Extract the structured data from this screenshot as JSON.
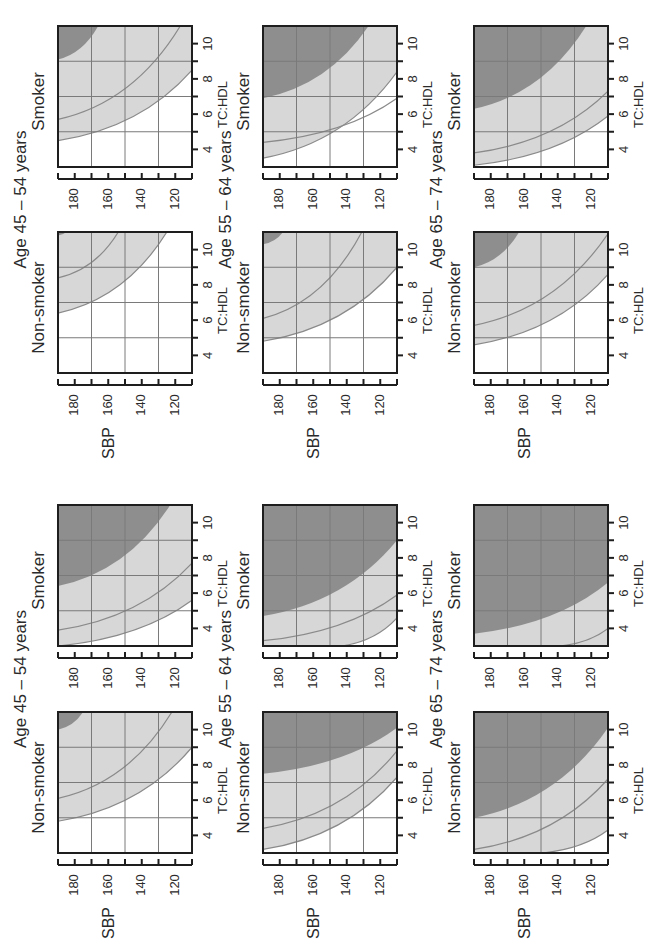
{
  "colors": {
    "background": "#ffffff",
    "dark_region": "#8e8e8e",
    "light_region": "#d7d7d7",
    "grid": "#7a7a7a",
    "frame": "#1e1e1e",
    "curve": "#8a8a8a"
  },
  "labels": {
    "sbp_axis": "SBP",
    "tc_axis": "TC:HDL",
    "smoker": "Smoker",
    "non_smoker": "Non-smoker"
  },
  "chart_data": {
    "type": "area",
    "orientation": "page rotated 90° counter-clockwise",
    "xlabel": "TC:HDL",
    "ylabel": "SBP",
    "x_ticks": [
      4,
      6,
      8,
      10
    ],
    "y_ticks": [
      120,
      140,
      160,
      180
    ],
    "xlim": [
      3,
      11
    ],
    "ylim": [
      110,
      190
    ],
    "grid": true,
    "regions_legend": [
      "dark shaded (highest risk band)",
      "light shaded (intermediate risk band)",
      "white (lowest risk band)"
    ],
    "groups": [
      {
        "name": "Upper chart set",
        "age_groups": [
          {
            "title": "Age 45 – 54 years",
            "panels": [
              {
                "label": "Non-smoker",
                "dark": {
                  "from": [
                    190,
                    10.8
                  ],
                  "to": [
                    185,
                    11
                  ]
                },
                "mid_line": {
                  "from": [
                    190,
                    8.4
                  ],
                  "to": [
                    154,
                    11
                  ]
                },
                "outer": {
                  "from": [
                    190,
                    6.4
                  ],
                  "to": [
                    125,
                    11
                  ]
                }
              },
              {
                "label": "Smoker",
                "dark": {
                  "from": [
                    190,
                    9.1
                  ],
                  "to": [
                    166,
                    11
                  ]
                },
                "mid_line": {
                  "from": [
                    190,
                    5.7
                  ],
                  "to": [
                    117,
                    11
                  ]
                },
                "outer": {
                  "from": [
                    190,
                    4.5
                  ],
                  "to": [
                    110,
                    8.5
                  ]
                }
              }
            ]
          },
          {
            "title": "Age 55 – 64 years",
            "panels": [
              {
                "label": "Non-smoker",
                "dark": {
                  "from": [
                    190,
                    10.3
                  ],
                  "to": [
                    178,
                    11
                  ]
                },
                "mid_line": {
                  "from": [
                    190,
                    6.1
                  ],
                  "to": [
                    131,
                    11
                  ]
                },
                "outer": {
                  "from": [
                    190,
                    4.8
                  ],
                  "to": [
                    110,
                    9.0
                  ]
                }
              },
              {
                "label": "Smoker",
                "dark": {
                  "from": [
                    190,
                    6.9
                  ],
                  "to": [
                    127,
                    11
                  ]
                },
                "mid_line": {
                  "from": [
                    190,
                    4.4
                  ],
                  "to": [
                    110,
                    6.9
                  ]
                },
                "outer": {
                  "from": [
                    190,
                    3.5
                  ],
                  "to": [
                    110,
                    8.4
                  ]
                }
              }
            ]
          },
          {
            "title": "Age 65 – 74 years",
            "panels": [
              {
                "label": "Non-smoker",
                "dark": {
                  "from": [
                    190,
                    9.0
                  ],
                  "to": [
                    163,
                    11
                  ]
                },
                "mid_line": {
                  "from": [
                    190,
                    5.7
                  ],
                  "to": [
                    110,
                    10.9
                  ]
                },
                "outer": {
                  "from": [
                    190,
                    4.6
                  ],
                  "to": [
                    110,
                    8.6
                  ]
                }
              },
              {
                "label": "Smoker",
                "dark": {
                  "from": [
                    190,
                    6.3
                  ],
                  "to": [
                    123,
                    11
                  ]
                },
                "mid_line": {
                  "from": [
                    190,
                    3.8
                  ],
                  "to": [
                    110,
                    7.3
                  ]
                },
                "outer": {
                  "from": [
                    190,
                    3.1
                  ],
                  "to": [
                    110,
                    5.9
                  ]
                }
              }
            ]
          }
        ]
      },
      {
        "name": "Lower chart set",
        "age_groups": [
          {
            "title": "Age 45 – 54 years",
            "panels": [
              {
                "label": "Non-smoker",
                "dark": {
                  "from": [
                    190,
                    10.0
                  ],
                  "to": [
                    175,
                    11
                  ]
                },
                "mid_line": {
                  "from": [
                    190,
                    6.1
                  ],
                  "to": [
                    122,
                    11
                  ]
                },
                "outer": {
                  "from": [
                    190,
                    4.8
                  ],
                  "to": [
                    110,
                    9.0
                  ]
                }
              },
              {
                "label": "Smoker",
                "dark": {
                  "from": [
                    190,
                    6.4
                  ],
                  "to": [
                    123,
                    11
                  ]
                },
                "mid_line": {
                  "from": [
                    190,
                    3.9
                  ],
                  "to": [
                    110,
                    7.7
                  ]
                },
                "outer": {
                  "from": [
                    190,
                    3.0
                  ],
                  "to": [
                    110,
                    5.6
                  ]
                }
              }
            ]
          },
          {
            "title": "Age 55 – 64 years",
            "panels": [
              {
                "label": "Non-smoker",
                "dark": {
                  "from": [
                    190,
                    7.5
                  ],
                  "to": [
                    110,
                    10.1
                  ]
                },
                "mid_line": {
                  "from": [
                    190,
                    4.4
                  ],
                  "to": [
                    110,
                    8.8
                  ]
                },
                "outer": {
                  "from": [
                    190,
                    3.2
                  ],
                  "to": [
                    110,
                    7.3
                  ]
                }
              },
              {
                "label": "Smoker",
                "dark": {
                  "from": [
                    190,
                    4.7
                  ],
                  "to": [
                    110,
                    9.0
                  ]
                },
                "mid_line": {
                  "from": [
                    190,
                    3.3
                  ],
                  "to": [
                    110,
                    5.9
                  ]
                },
                "outer": {
                  "from": [
                    143,
                    3
                  ],
                  "to": [
                    110,
                    4.6
                  ]
                }
              }
            ]
          },
          {
            "title": "Age 65 – 74 years",
            "panels": [
              {
                "label": "Non-smoker",
                "dark": {
                  "from": [
                    190,
                    5.0
                  ],
                  "to": [
                    110,
                    10.1
                  ]
                },
                "mid_line": {
                  "from": [
                    190,
                    3.2
                  ],
                  "to": [
                    110,
                    7.2
                  ]
                },
                "outer": {
                  "from": [
                    149,
                    3
                  ],
                  "to": [
                    110,
                    4.3
                  ]
                }
              },
              {
                "label": "Smoker",
                "dark": {
                  "from": [
                    190,
                    3.7
                  ],
                  "to": [
                    110,
                    6.6
                  ]
                },
                "mid_line": {
                  "from": [
                    139,
                    3
                  ],
                  "to": [
                    110,
                    4.0
                  ]
                },
                "outer": null
              }
            ]
          }
        ]
      }
    ]
  }
}
